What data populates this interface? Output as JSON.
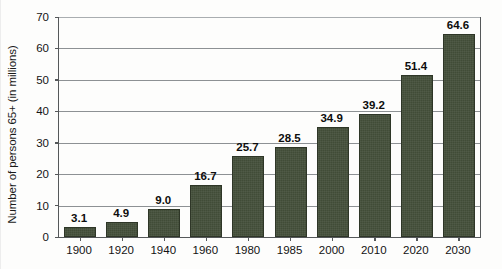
{
  "chart_data": {
    "type": "bar",
    "title": "",
    "xlabel": "",
    "ylabel": "Number of persons 65+ (in millions)",
    "categories": [
      "1900",
      "1920",
      "1940",
      "1960",
      "1980",
      "1985",
      "2000",
      "2010",
      "2020",
      "2030"
    ],
    "values": [
      3.1,
      4.9,
      9.0,
      16.7,
      25.7,
      28.5,
      34.9,
      39.2,
      51.4,
      64.6
    ],
    "value_labels": [
      "3.1",
      "4.9",
      "9.0",
      "16.7",
      "25.7",
      "28.5",
      "34.9",
      "39.2",
      "51.4",
      "64.6"
    ],
    "ylim": [
      0,
      70
    ],
    "yticks": [
      0,
      10,
      20,
      30,
      40,
      50,
      60,
      70
    ],
    "ytick_labels": [
      "0",
      "10",
      "20",
      "30",
      "40",
      "50",
      "60",
      "70"
    ],
    "grid": true,
    "grid_axis": "y",
    "legend": false,
    "bar_color": "#414c37",
    "bar_edge_color": "#2e3627",
    "grid_color": "#8d9194",
    "axis_color": "#55585a",
    "text_color": "#131313",
    "background": "#fdfdfc"
  }
}
